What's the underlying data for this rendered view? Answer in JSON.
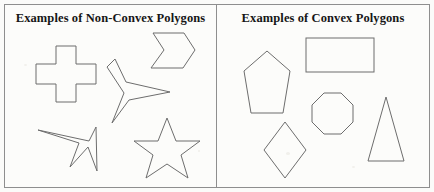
{
  "figure": {
    "width": 434,
    "height": 192,
    "background_color": "#fbfbf9",
    "stroke_color": "#6d6d6d",
    "border_color": "#8e8e8e"
  },
  "panels": [
    {
      "id": "non-convex",
      "title": "Examples of Non-Convex Polygons",
      "shapes": [
        {
          "name": "cross",
          "label": "cross",
          "points": "56,46 76,46 76,64 96,64 96,84 76,84 76,102 56,102 56,84 36,84 36,64 56,64"
        },
        {
          "name": "chevron",
          "label": "chevron",
          "points": "153,33 184,33 195,50 183,68 151,68 164,50"
        },
        {
          "name": "three-point-dart",
          "label": "three-point-dart",
          "points": "115,59 126,82 170,92 129,100 112,123 124,93 107,67"
        },
        {
          "name": "arrow-cursor",
          "label": "arrow-cursor",
          "points": "96,127 97,171 88,147 70,167 79,143 38,130 89,141"
        },
        {
          "name": "five-point-star",
          "label": "five-point-star",
          "points": "167,118 176,141 200,141 181,155 188,178 167,164 146,178 153,155 134,141 158,141"
        }
      ]
    },
    {
      "id": "convex",
      "title": "Examples of Convex Polygons",
      "shapes": [
        {
          "name": "pentagon",
          "label": "pentagon",
          "points": "267,51 290,71 283,113 251,113 244,71"
        },
        {
          "name": "rectangle",
          "label": "rectangle",
          "x": 306,
          "y": 38,
          "width": 68,
          "height": 34
        },
        {
          "name": "octagon",
          "label": "octagon",
          "points": "324,93 341,93 353,105 353,122 341,134 324,134 312,122 312,105"
        },
        {
          "name": "diamond",
          "label": "diamond",
          "points": "285,122 306,150 285,178 264,150"
        },
        {
          "name": "triangle",
          "label": "triangle",
          "points": "386,97 404,161 368,161"
        }
      ]
    }
  ]
}
